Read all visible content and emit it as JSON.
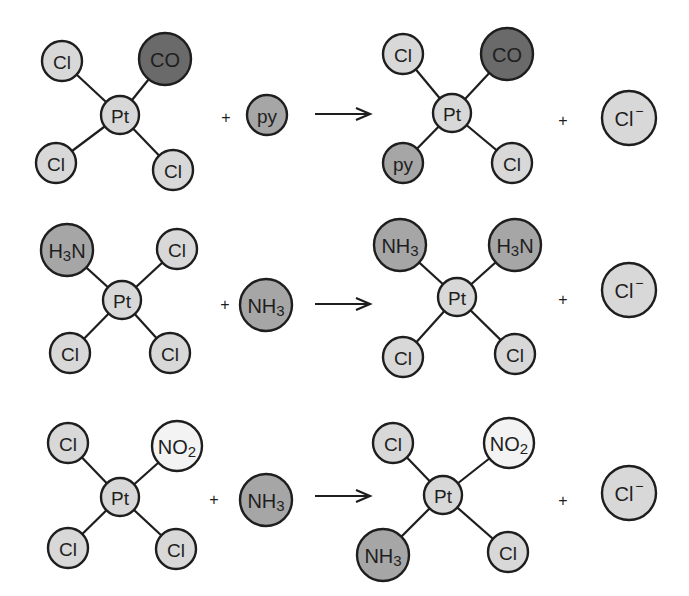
{
  "colors": {
    "light": "#d8d8d8",
    "medium": "#a6a6a6",
    "dark": "#6a6a6a",
    "white": "#f3f3f3",
    "stroke": "#1e1e1e"
  },
  "reactions": [
    {
      "reactant_complex": {
        "center": {
          "label": "Pt",
          "x": 120,
          "y": 115,
          "r": 19,
          "fill": "light"
        },
        "ligands": [
          {
            "label": "Cl",
            "x": 62,
            "y": 61,
            "r": 20,
            "fill": "light"
          },
          {
            "label": "CO",
            "x": 165,
            "y": 59,
            "r": 26,
            "fill": "dark"
          },
          {
            "label": "Cl",
            "x": 56,
            "y": 163,
            "r": 20,
            "fill": "light"
          },
          {
            "label": "Cl",
            "x": 173,
            "y": 170,
            "r": 20,
            "fill": "light"
          }
        ]
      },
      "plus1": {
        "label": "+",
        "x": 226,
        "y": 117
      },
      "reagent": {
        "label": "py",
        "x": 267,
        "y": 115,
        "r": 20,
        "fill": "medium"
      },
      "arrow": {
        "x1": 315,
        "x2": 370,
        "y": 114
      },
      "product_complex": {
        "center": {
          "label": "Pt",
          "x": 452,
          "y": 113,
          "r": 19,
          "fill": "light"
        },
        "ligands": [
          {
            "label": "Cl",
            "x": 403,
            "y": 54,
            "r": 20,
            "fill": "light"
          },
          {
            "label": "CO",
            "x": 507,
            "y": 54,
            "r": 26,
            "fill": "dark"
          },
          {
            "label": "py",
            "x": 403,
            "y": 163,
            "r": 20,
            "fill": "medium"
          },
          {
            "label": "Cl",
            "x": 512,
            "y": 163,
            "r": 20,
            "fill": "light"
          }
        ]
      },
      "plus2": {
        "label": "+",
        "x": 563,
        "y": 120
      },
      "leaving_group": {
        "label": "Cl",
        "sup": "−",
        "x": 629,
        "y": 118,
        "r": 27,
        "fill": "light"
      }
    },
    {
      "reactant_complex": {
        "center": {
          "label": "Pt",
          "x": 122,
          "y": 300,
          "r": 19,
          "fill": "light"
        },
        "ligands": [
          {
            "label": "H",
            "sub": "3",
            "tail": "N",
            "x": 67,
            "y": 250,
            "r": 26,
            "fill": "medium"
          },
          {
            "label": "Cl",
            "x": 177,
            "y": 249,
            "r": 20,
            "fill": "light"
          },
          {
            "label": "Cl",
            "x": 70,
            "y": 353,
            "r": 20,
            "fill": "light"
          },
          {
            "label": "Cl",
            "x": 170,
            "y": 353,
            "r": 20,
            "fill": "light"
          }
        ]
      },
      "plus1": {
        "label": "+",
        "x": 225,
        "y": 304
      },
      "reagent": {
        "label": "NH",
        "sub": "3",
        "x": 266,
        "y": 305,
        "r": 26,
        "fill": "medium"
      },
      "arrow": {
        "x1": 315,
        "x2": 370,
        "y": 304
      },
      "product_complex": {
        "center": {
          "label": "Pt",
          "x": 457,
          "y": 297,
          "r": 19,
          "fill": "light"
        },
        "ligands": [
          {
            "label": "NH",
            "sub": "3",
            "x": 400,
            "y": 245,
            "r": 26,
            "fill": "medium"
          },
          {
            "label": "H",
            "sub": "3",
            "tail": "N",
            "x": 515,
            "y": 245,
            "r": 26,
            "fill": "medium"
          },
          {
            "label": "Cl",
            "x": 403,
            "y": 357,
            "r": 20,
            "fill": "light"
          },
          {
            "label": "Cl",
            "x": 515,
            "y": 354,
            "r": 20,
            "fill": "light"
          }
        ]
      },
      "plus2": {
        "label": "+",
        "x": 563,
        "y": 299
      },
      "leaving_group": {
        "label": "Cl",
        "sup": "−",
        "x": 629,
        "y": 290,
        "r": 27,
        "fill": "light"
      }
    },
    {
      "reactant_complex": {
        "center": {
          "label": "Pt",
          "x": 120,
          "y": 497,
          "r": 19,
          "fill": "light"
        },
        "ligands": [
          {
            "label": "Cl",
            "x": 68,
            "y": 443,
            "r": 20,
            "fill": "light"
          },
          {
            "label": "NO",
            "sub": "2",
            "x": 177,
            "y": 446,
            "r": 25,
            "fill": "white"
          },
          {
            "label": "Cl",
            "x": 68,
            "y": 548,
            "r": 20,
            "fill": "light"
          },
          {
            "label": "Cl",
            "x": 176,
            "y": 549,
            "r": 20,
            "fill": "light"
          }
        ]
      },
      "plus1": {
        "label": "+",
        "x": 214,
        "y": 499
      },
      "reagent": {
        "label": "NH",
        "sub": "3",
        "x": 266,
        "y": 500,
        "r": 26,
        "fill": "medium"
      },
      "arrow": {
        "x1": 315,
        "x2": 370,
        "y": 496
      },
      "product_complex": {
        "center": {
          "label": "Pt",
          "x": 443,
          "y": 495,
          "r": 19,
          "fill": "light"
        },
        "ligands": [
          {
            "label": "Cl",
            "x": 393,
            "y": 443,
            "r": 20,
            "fill": "light"
          },
          {
            "label": "NO",
            "sub": "2",
            "x": 509,
            "y": 443,
            "r": 25,
            "fill": "white"
          },
          {
            "label": "NH",
            "sub": "3",
            "x": 383,
            "y": 555,
            "r": 26,
            "fill": "medium"
          },
          {
            "label": "Cl",
            "x": 508,
            "y": 552,
            "r": 20,
            "fill": "light"
          }
        ]
      },
      "plus2": {
        "label": "+",
        "x": 563,
        "y": 500
      },
      "leaving_group": {
        "label": "Cl",
        "sup": "−",
        "x": 629,
        "y": 493,
        "r": 27,
        "fill": "light"
      }
    }
  ]
}
